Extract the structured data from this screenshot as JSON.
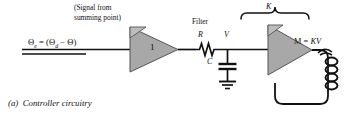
{
  "figure": {
    "caption_index": "(a)",
    "caption_text": "Controller circuitry",
    "type": "schematic-diagram",
    "background": "#ffffff",
    "ink_color": "#111111",
    "block_fill": "#a8a8a8",
    "block_stroke": "#444444"
  },
  "annotations": {
    "source_note_line1": "(Signal from",
    "source_note_line2": "summing point)",
    "error_equation": {
      "lhs_symbol": "Θ",
      "lhs_subscript": "e",
      "equals": "=",
      "rhs": "(Θ",
      "rhs_subscript": "d",
      "rhs_tail": " − Θ)",
      "full": "Θe = (Θd − Θ)"
    },
    "filter_label": "Filter",
    "gain_brace_label": "K",
    "output_equation": "M = KV",
    "output_equation_upright": "M",
    "output_equation_equals": "=",
    "output_equation_italic": "KV"
  },
  "components": [
    {
      "id": "amp1",
      "kind": "amplifier-triangle",
      "label": "1",
      "notch": true
    },
    {
      "id": "resistor",
      "kind": "resistor",
      "label": "R"
    },
    {
      "id": "node_v",
      "kind": "node-label",
      "label": "V"
    },
    {
      "id": "capacitor",
      "kind": "capacitor",
      "label": "C"
    },
    {
      "id": "ground",
      "kind": "ground-symbol",
      "label": ""
    },
    {
      "id": "amp2",
      "kind": "amplifier-triangle",
      "label": "",
      "notch": true
    },
    {
      "id": "coil",
      "kind": "motor-coil",
      "label": ""
    }
  ],
  "component_labels": {
    "amp1": "1",
    "resistor": "R",
    "node": "V",
    "capacitor": "C"
  }
}
